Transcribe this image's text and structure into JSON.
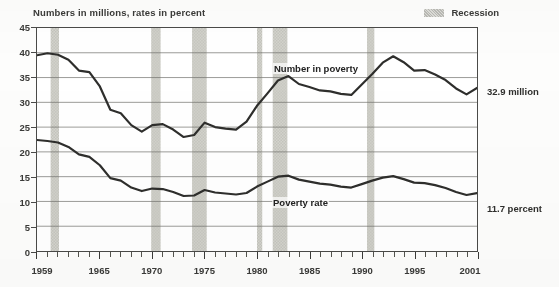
{
  "header": {
    "axis_note": "Numbers in millions, rates in percent",
    "legend_label": "Recession",
    "legend_swatch_color": "#cfcfc9"
  },
  "callouts": {
    "number_value": "32.9 million",
    "rate_value": "11.7 percent"
  },
  "series_tags": {
    "number": "Number in poverty",
    "rate": "Poverty rate"
  },
  "chart_data": {
    "type": "line",
    "title": "",
    "subtitle": "Numbers in millions, rates in percent",
    "xlabel": "",
    "ylabel": "Numbers in millions, rates in percent",
    "xlim": [
      1959,
      2001
    ],
    "ylim": [
      0,
      45
    ],
    "yticks": [
      0,
      5,
      10,
      15,
      20,
      25,
      30,
      35,
      40,
      45
    ],
    "xticks_labeled": [
      1959,
      1965,
      1970,
      1975,
      1980,
      1985,
      1990,
      1995,
      2001
    ],
    "xtick_interval_years": 1,
    "grid": "horizontal",
    "legend_position": "top-right",
    "line_color": "#2e2e2c",
    "recession_band_color": "#cfcfc9",
    "x": [
      1959,
      1960,
      1961,
      1962,
      1963,
      1964,
      1965,
      1966,
      1967,
      1968,
      1969,
      1970,
      1971,
      1972,
      1973,
      1974,
      1975,
      1976,
      1977,
      1978,
      1979,
      1980,
      1981,
      1982,
      1983,
      1984,
      1985,
      1986,
      1987,
      1988,
      1989,
      1990,
      1991,
      1992,
      1993,
      1994,
      1995,
      1996,
      1997,
      1998,
      1999,
      2000,
      2001
    ],
    "series": [
      {
        "name": "Number in poverty",
        "unit": "millions",
        "values": [
          39.5,
          39.9,
          39.6,
          38.6,
          36.4,
          36.1,
          33.2,
          28.5,
          27.8,
          25.4,
          24.1,
          25.4,
          25.6,
          24.5,
          23.0,
          23.4,
          25.9,
          25.0,
          24.7,
          24.5,
          26.1,
          29.3,
          31.8,
          34.4,
          35.3,
          33.7,
          33.1,
          32.4,
          32.2,
          31.7,
          31.5,
          33.6,
          35.7,
          38.0,
          39.3,
          38.1,
          36.4,
          36.5,
          35.6,
          34.5,
          32.8,
          31.6,
          32.9
        ],
        "end_label": "32.9 million"
      },
      {
        "name": "Poverty rate",
        "unit": "percent",
        "values": [
          22.4,
          22.2,
          21.9,
          21.0,
          19.5,
          19.0,
          17.3,
          14.7,
          14.2,
          12.8,
          12.1,
          12.6,
          12.5,
          11.9,
          11.1,
          11.2,
          12.3,
          11.8,
          11.6,
          11.4,
          11.7,
          13.0,
          14.0,
          15.0,
          15.2,
          14.4,
          14.0,
          13.6,
          13.4,
          13.0,
          12.8,
          13.5,
          14.2,
          14.8,
          15.1,
          14.5,
          13.8,
          13.7,
          13.3,
          12.7,
          11.9,
          11.3,
          11.7
        ],
        "end_label": "11.7 percent"
      }
    ],
    "recessions": [
      {
        "start": 1960.3,
        "end": 1961.1
      },
      {
        "start": 1969.9,
        "end": 1970.8
      },
      {
        "start": 1973.8,
        "end": 1975.2
      },
      {
        "start": 1980.0,
        "end": 1980.5
      },
      {
        "start": 1981.5,
        "end": 1982.9
      },
      {
        "start": 1990.5,
        "end": 1991.2
      },
      {
        "start": 2001.2,
        "end": 2001.9
      }
    ]
  }
}
